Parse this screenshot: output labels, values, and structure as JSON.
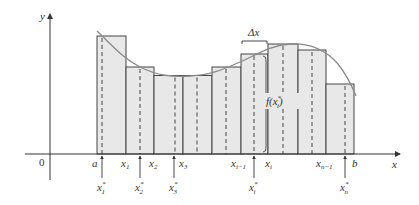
{
  "figure": {
    "axis": {
      "x_label": "x",
      "y_label": "y",
      "origin_label": "0"
    },
    "colors": {
      "axis": "#333333",
      "rect_fill": "#e8e8e8",
      "rect_stroke": "#444444",
      "curve": "#8a8a8a",
      "dash": "#444444",
      "text": "#333333"
    },
    "partition_labels": [
      {
        "text": "a",
        "sub": ""
      },
      {
        "text": "x",
        "sub": "1"
      },
      {
        "text": "x",
        "sub": "2"
      },
      {
        "text": "x",
        "sub": "3"
      },
      {
        "text": "x",
        "sub": "i−1"
      },
      {
        "text": "x",
        "sub": "i"
      },
      {
        "text": "x",
        "sub": "n−1"
      },
      {
        "text": "b",
        "sub": ""
      }
    ],
    "sample_labels": [
      {
        "text": "x",
        "sub": "1",
        "sup": "*"
      },
      {
        "text": "x",
        "sub": "2",
        "sup": "*"
      },
      {
        "text": "x",
        "sub": "3",
        "sup": "*"
      },
      {
        "text": "x",
        "sub": "i",
        "sup": "*"
      },
      {
        "text": "x",
        "sub": "n",
        "sup": "*"
      }
    ],
    "delta_label": "Δx",
    "height_label": {
      "text": "f(x",
      "sub": "i",
      "sup": "*",
      "close": ")"
    }
  },
  "chart_data": {
    "type": "riemann-sum",
    "function": "f(x)",
    "interval": [
      "a",
      "b"
    ],
    "subintervals": 9,
    "rectangles": [
      {
        "left": 97,
        "right": 126,
        "top": 36,
        "sample": 102
      },
      {
        "left": 126,
        "right": 154,
        "top": 67,
        "sample": 140
      },
      {
        "left": 154,
        "right": 183,
        "top": 75.5,
        "sample": 175
      },
      {
        "left": 183,
        "right": 212,
        "top": 75.5,
        "sample": 197
      },
      {
        "left": 212,
        "right": 241,
        "top": 67,
        "sample": 226
      },
      {
        "left": 241,
        "right": 268,
        "top": 54,
        "sample": 254
      },
      {
        "left": 268,
        "right": 298,
        "top": 44,
        "sample": 283
      },
      {
        "left": 298,
        "right": 326,
        "top": 50,
        "sample": 312
      },
      {
        "left": 326,
        "right": 354,
        "top": 84,
        "sample": 345
      }
    ],
    "axis_y": 154,
    "y_axis_x": 50
  }
}
